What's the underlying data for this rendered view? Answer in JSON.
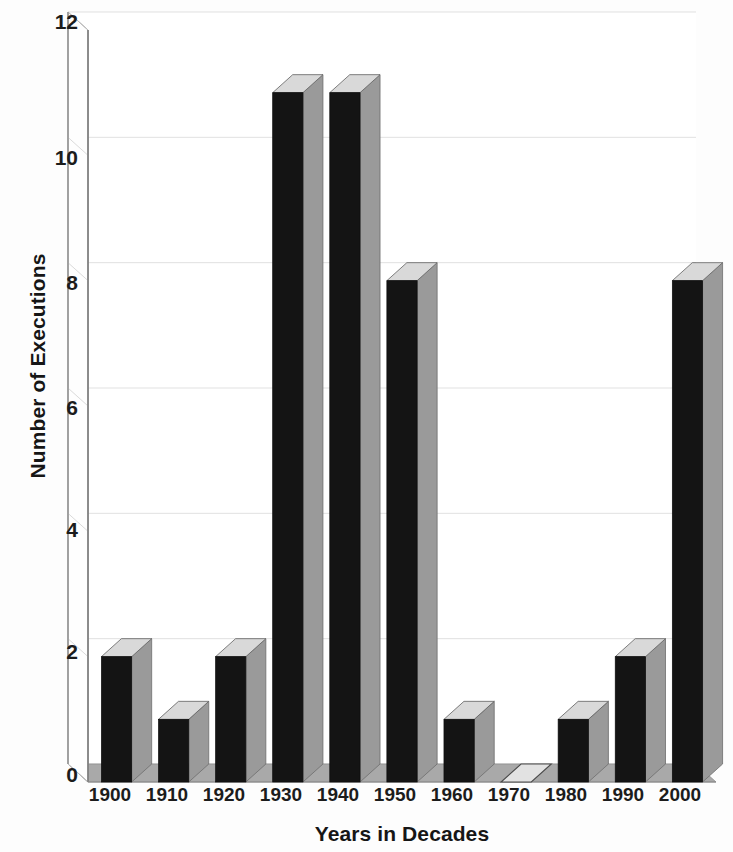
{
  "chart_data": {
    "type": "bar",
    "title": "",
    "subtitle": "",
    "xlabel": "Years in Decades",
    "ylabel": "Number of Executions",
    "categories": [
      "1900",
      "1910",
      "1920",
      "1930",
      "1940",
      "1950",
      "1960",
      "1970",
      "1980",
      "1990",
      "2000"
    ],
    "values": [
      2,
      1,
      2,
      11,
      11,
      8,
      1,
      0,
      1,
      2,
      8
    ],
    "series": [
      {
        "name": "Number of Executions",
        "values": [
          2,
          1,
          2,
          11,
          11,
          8,
          1,
          0,
          1,
          2,
          8
        ]
      }
    ],
    "ylim": [
      0,
      12
    ],
    "yticks": [
      0,
      2,
      4,
      6,
      8,
      10,
      12
    ],
    "ytick_labels": [
      "0",
      "2",
      "4",
      "6",
      "8",
      "10",
      "12"
    ],
    "xtick_labels": [
      "1900",
      "1910",
      "1920",
      "1930",
      "1940",
      "1950",
      "1960",
      "1970",
      "1980",
      "1990",
      "2000"
    ],
    "grid": true,
    "legend": false,
    "legend_position": "none",
    "style": "3d-column",
    "annotations": [],
    "colors": {
      "bar_front": "#141414",
      "bar_side": "#9a9a9a",
      "bar_top": "#d9d9d9",
      "floor": "#a9a9a9",
      "gridline": "#cfcfcf",
      "axis": "#8d8d8d",
      "background": "#fdfdfd",
      "text": "#161616"
    }
  },
  "axes": {
    "y_title": "Number of Executions",
    "x_title": "Years in Decades",
    "y_ticks": [
      {
        "label": "12"
      },
      {
        "label": "10"
      },
      {
        "label": "8"
      },
      {
        "label": "6"
      },
      {
        "label": "4"
      },
      {
        "label": "2"
      },
      {
        "label": "0"
      }
    ],
    "x_ticks": [
      {
        "label": "1900"
      },
      {
        "label": "1910"
      },
      {
        "label": "1920"
      },
      {
        "label": "1930"
      },
      {
        "label": "1940"
      },
      {
        "label": "1950"
      },
      {
        "label": "1960"
      },
      {
        "label": "1970"
      },
      {
        "label": "1980"
      },
      {
        "label": "1990"
      },
      {
        "label": "2000"
      }
    ]
  }
}
